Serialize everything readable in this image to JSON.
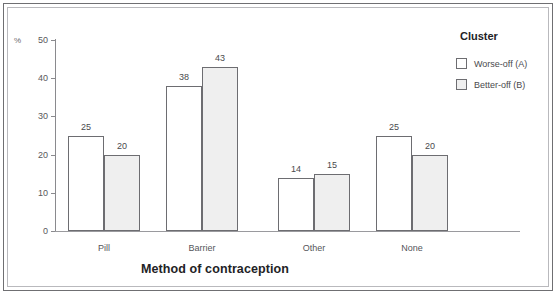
{
  "chart_data": {
    "type": "bar",
    "title": "",
    "xlabel": "Method of contraception",
    "ylabel": "%",
    "categories": [
      "Pill",
      "Barrier",
      "Other",
      "None"
    ],
    "series": [
      {
        "name": "Worse-off (A)",
        "values": [
          25,
          38,
          14,
          25
        ],
        "fill": "#ffffff"
      },
      {
        "name": "Better-off (B)",
        "values": [
          20,
          43,
          15,
          20
        ],
        "fill": "#efefef"
      }
    ],
    "ylim": [
      0,
      50
    ],
    "yticks": [
      0,
      10,
      20,
      30,
      40,
      50
    ],
    "ytick_labels": [
      "0",
      "10",
      "20",
      "30",
      "40",
      "50"
    ],
    "grid": false,
    "legend": {
      "title": "Cluster",
      "position": "top-right",
      "entries": [
        "Worse-off (A)",
        "Better-off (B)"
      ]
    },
    "data_labels": [
      "25",
      "20",
      "38",
      "43",
      "14",
      "15",
      "25",
      "20"
    ]
  },
  "axis": {
    "unit_label": "%"
  }
}
